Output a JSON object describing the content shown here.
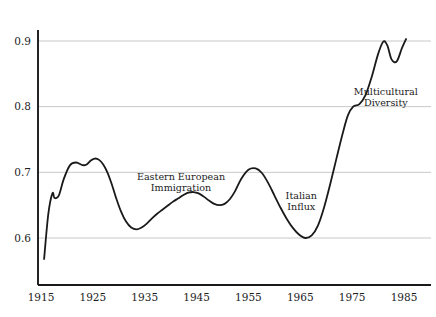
{
  "chart_data": {
    "type": "line",
    "title": "",
    "subtitle": "",
    "xlabel": "",
    "ylabel": "",
    "xlim": [
      1915,
      1986
    ],
    "ylim": [
      0.555,
      0.925
    ],
    "grid": "horizontal",
    "legend": "none",
    "axis_color": "#1a1a1a",
    "grid_color": "#c8c8c8",
    "line_color": "#1a1a1a",
    "line_width": 1.8,
    "x_ticks": [
      1915,
      1925,
      1935,
      1945,
      1955,
      1965,
      1975,
      1985
    ],
    "x_tick_labels": [
      "1915",
      "1925",
      "1935",
      "1945",
      "1955",
      "1965",
      "1975",
      "1985"
    ],
    "y_ticks": [
      0.6,
      0.7,
      0.8,
      0.9
    ],
    "y_tick_labels": [
      "0.6",
      "0.7",
      "0.8",
      "0.9"
    ],
    "series": [
      {
        "name": "series-1",
        "x": [
          1915.6,
          1916.4,
          1917.2,
          1917.6,
          1918.4,
          1919.4,
          1920.6,
          1921.8,
          1923.0,
          1923.8,
          1924.6,
          1925.4,
          1926.2,
          1927.0,
          1927.8,
          1928.6,
          1929.4,
          1930.4,
          1931.4,
          1932.4,
          1933.4,
          1934.4,
          1935.4,
          1936.4,
          1937.4,
          1938.4,
          1939.4,
          1940.4,
          1941.4,
          1942.4,
          1943.4,
          1944.4,
          1945.4,
          1946.4,
          1947.4,
          1948.4,
          1949.4,
          1950.4,
          1951.4,
          1952.4,
          1953.6,
          1955.0,
          1956.4,
          1957.6,
          1958.8,
          1960.0,
          1961.2,
          1962.4,
          1963.6,
          1964.8,
          1966.0,
          1967.2,
          1968.4,
          1969.6,
          1970.8,
          1972.0,
          1973.2,
          1974.2,
          1975.2,
          1976.4,
          1977.6,
          1978.8,
          1980.0,
          1981.0,
          1981.8,
          1982.6,
          1983.6,
          1984.6,
          1985.4
        ],
        "y": [
          0.568,
          0.636,
          0.668,
          0.661,
          0.664,
          0.69,
          0.711,
          0.715,
          0.711,
          0.712,
          0.718,
          0.721,
          0.719,
          0.712,
          0.7,
          0.683,
          0.663,
          0.641,
          0.625,
          0.616,
          0.613,
          0.616,
          0.622,
          0.63,
          0.637,
          0.643,
          0.649,
          0.655,
          0.66,
          0.665,
          0.669,
          0.67,
          0.668,
          0.663,
          0.657,
          0.652,
          0.65,
          0.652,
          0.659,
          0.671,
          0.69,
          0.704,
          0.706,
          0.699,
          0.684,
          0.665,
          0.646,
          0.629,
          0.615,
          0.605,
          0.6,
          0.604,
          0.619,
          0.647,
          0.683,
          0.722,
          0.76,
          0.787,
          0.8,
          0.804,
          0.818,
          0.846,
          0.88,
          0.899,
          0.893,
          0.872,
          0.869,
          0.889,
          0.903
        ]
      }
    ],
    "annotations": [
      {
        "id": "eastern-european-immigration",
        "lines": [
          "Eastern European",
          "Immigration"
        ],
        "x": 1942.0,
        "y": 0.688,
        "anchor": "middle"
      },
      {
        "id": "italian-influx",
        "lines": [
          "Italian",
          "Influx"
        ],
        "x": 1965.2,
        "y": 0.66,
        "anchor": "middle"
      },
      {
        "id": "multicultural-diversity",
        "lines": [
          "Multicultural",
          "Diversity"
        ],
        "x": 1981.5,
        "y": 0.818,
        "anchor": "middle"
      }
    ]
  }
}
